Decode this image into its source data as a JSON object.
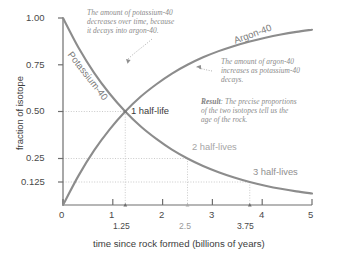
{
  "chart_data": {
    "type": "line",
    "title": "",
    "xlabel": "time since rock formed (billions of years)",
    "ylabel": "fraction of isotope",
    "xlim": [
      0,
      5
    ],
    "ylim": [
      0,
      1
    ],
    "grid": false,
    "x_ticks": [
      "0",
      "1",
      "2",
      "3",
      "4",
      "5"
    ],
    "x_tick_values": [
      0,
      1,
      2,
      3,
      4,
      5
    ],
    "x_subticks": [
      "1.25",
      "2.5",
      "3.75"
    ],
    "x_subtick_values": [
      1.25,
      2.5,
      3.75
    ],
    "y_ticks": [
      "1.00",
      "0.75",
      "0.50",
      "0.25",
      "0.125"
    ],
    "y_tick_values": [
      1.0,
      0.75,
      0.5,
      0.25,
      0.125
    ],
    "half_life_years": 1.25,
    "series": [
      {
        "name": "Potassium-40",
        "kind": "decay",
        "x": [
          0,
          0.3125,
          0.625,
          0.9375,
          1.25,
          1.5625,
          1.875,
          2.1875,
          2.5,
          2.8125,
          3.125,
          3.4375,
          3.75,
          4.0625,
          4.375,
          4.6875,
          5
        ],
        "values": [
          1.0,
          0.841,
          0.707,
          0.595,
          0.5,
          0.42,
          0.354,
          0.297,
          0.25,
          0.21,
          0.177,
          0.149,
          0.125,
          0.105,
          0.088,
          0.074,
          0.0625
        ]
      },
      {
        "name": "Argon-40",
        "kind": "growth",
        "x": [
          0,
          0.3125,
          0.625,
          0.9375,
          1.25,
          1.5625,
          1.875,
          2.1875,
          2.5,
          2.8125,
          3.125,
          3.4375,
          3.75,
          4.0625,
          4.375,
          4.6875,
          5
        ],
        "values": [
          0.0,
          0.159,
          0.293,
          0.405,
          0.5,
          0.58,
          0.646,
          0.703,
          0.75,
          0.79,
          0.823,
          0.851,
          0.875,
          0.895,
          0.912,
          0.926,
          0.9375
        ]
      }
    ],
    "markers": [
      {
        "label": "1 half-life",
        "x": 1.25,
        "y": 0.5
      },
      {
        "label": "2 half-lives",
        "x": 2.5,
        "y": 0.25
      },
      {
        "label": "3 half-lives",
        "x": 3.75,
        "y": 0.125
      }
    ],
    "annotations": [
      {
        "id": "potassium-note",
        "text": "The amount of potassium-40 decreases over time, because it decays into argon-40.",
        "lines": [
          "The amount of potassium-40",
          "decreases over time, because",
          "it decays into argon-40."
        ]
      },
      {
        "id": "argon-note",
        "text": "The amount of argon-40 increases as potassium-40 decays.",
        "lines": [
          "The amount of argon-40",
          "increases as potassium-40",
          "decays."
        ]
      },
      {
        "id": "result-note",
        "label": "Result",
        "text": "Result: The precise proportions of the two isotopes tell us the age of the rock.",
        "lines": [
          ": The precise proportions",
          "of the two isotopes tell us the",
          "age of the rock."
        ]
      }
    ],
    "curve_labels": {
      "potassium": "Potassium-40",
      "argon": "Argon-40"
    },
    "colors": {
      "curve": "#8c8c8c",
      "axis": "#6e6e6e",
      "guide": "#b5b5b5",
      "note_text": "#8a8a8a",
      "tick_text": "#4a4a4a",
      "background": "#ffffff"
    }
  },
  "labels": {
    "half_life_1": "1 half-life",
    "half_life_2": "2 half-lives",
    "half_life_3": "3 half-lives",
    "result_bold": "Result",
    "y_axis_title": "fraction of isotope",
    "x_axis_title": "time since rock formed (billions of years)"
  }
}
